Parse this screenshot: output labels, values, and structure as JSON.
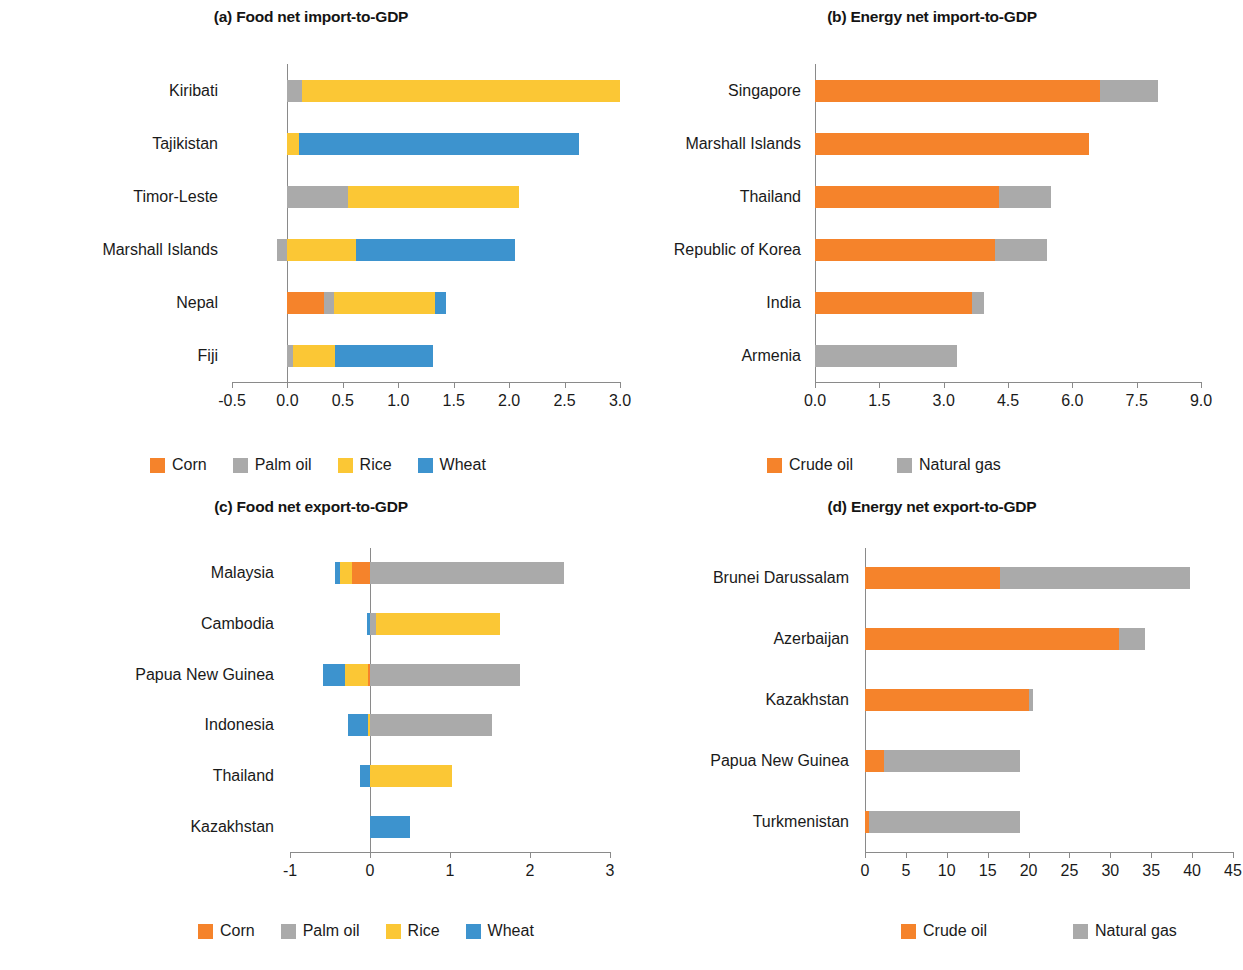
{
  "figure": {
    "width": 1243,
    "height": 970
  },
  "colors": {
    "corn": "#F5832B",
    "crude_oil": "#F5832B",
    "palm_oil": "#AAAAAA",
    "natural_gas": "#AAAAAA",
    "rice": "#FBC735",
    "wheat": "#3D93CE",
    "axis": "#8A8A8A",
    "text": "#1A1A1A"
  },
  "legends": {
    "food": [
      {
        "label": "Corn",
        "color_key": "corn",
        "icon": "legend-swatch-corn"
      },
      {
        "label": "Palm oil",
        "color_key": "palm_oil",
        "icon": "legend-swatch-palm-oil"
      },
      {
        "label": "Rice",
        "color_key": "rice",
        "icon": "legend-swatch-rice"
      },
      {
        "label": "Wheat",
        "color_key": "wheat",
        "icon": "legend-swatch-wheat"
      }
    ],
    "energy": [
      {
        "label": "Crude oil",
        "color_key": "crude_oil",
        "icon": "legend-swatch-crude-oil"
      },
      {
        "label": "Natural gas",
        "color_key": "natural_gas",
        "icon": "legend-swatch-natural-gas"
      }
    ]
  },
  "chart_data": [
    {
      "id": "panel-a",
      "type": "bar",
      "orientation": "horizontal",
      "stacked": true,
      "title": "(a) Food net import-to-GDP",
      "xlabel": "",
      "ylabel": "",
      "xlim": [
        -0.5,
        3.0
      ],
      "ticks": [
        -0.5,
        0.0,
        0.5,
        1.0,
        1.5,
        2.0,
        2.5,
        3.0
      ],
      "tick_labels": [
        "-0.5",
        "0.0",
        "0.5",
        "1.0",
        "1.5",
        "2.0",
        "2.5",
        "3.0"
      ],
      "grid": false,
      "legend": "food",
      "legend_position": "bottom",
      "categories": [
        "Kiribati",
        "Tajikistan",
        "Timor-Leste",
        "Marshall Islands",
        "Nepal",
        "Fiji"
      ],
      "series": [
        {
          "name": "Corn",
          "color_key": "corn",
          "values": [
            0.0,
            0.0,
            0.0,
            0.0,
            0.33,
            0.0
          ]
        },
        {
          "name": "Palm oil",
          "color_key": "palm_oil",
          "values": [
            0.13,
            0.0,
            0.55,
            -0.09,
            0.09,
            0.05
          ]
        },
        {
          "name": "Rice",
          "color_key": "rice",
          "values": [
            2.87,
            0.1,
            1.54,
            0.62,
            0.91,
            0.38
          ]
        },
        {
          "name": "Wheat",
          "color_key": "wheat",
          "values": [
            0.0,
            2.53,
            0.0,
            1.43,
            0.1,
            0.88
          ]
        }
      ],
      "totals": [
        3.0,
        2.63,
        2.09,
        2.05,
        1.43,
        1.31
      ]
    },
    {
      "id": "panel-b",
      "type": "bar",
      "orientation": "horizontal",
      "stacked": true,
      "title": "(b) Energy net import-to-GDP",
      "xlabel": "",
      "ylabel": "",
      "xlim": [
        0.0,
        9.0
      ],
      "ticks": [
        0.0,
        1.5,
        3.0,
        4.5,
        6.0,
        7.5,
        9.0
      ],
      "tick_labels": [
        "0.0",
        "1.5",
        "3.0",
        "4.5",
        "6.0",
        "7.5",
        "9.0"
      ],
      "grid": false,
      "legend": "energy",
      "legend_position": "bottom",
      "categories": [
        "Singapore",
        "Marshall Islands",
        "Thailand",
        "Republic of Korea",
        "India",
        "Armenia"
      ],
      "series": [
        {
          "name": "Crude oil",
          "color_key": "crude_oil",
          "values": [
            6.65,
            6.4,
            4.3,
            4.2,
            3.65,
            0.0
          ]
        },
        {
          "name": "Natural gas",
          "color_key": "natural_gas",
          "values": [
            1.35,
            0.0,
            1.2,
            1.2,
            0.3,
            3.3
          ]
        }
      ],
      "totals": [
        8.0,
        6.4,
        5.5,
        5.4,
        3.95,
        3.3
      ]
    },
    {
      "id": "panel-c",
      "type": "bar",
      "orientation": "horizontal",
      "stacked": true,
      "title": "(c) Food net export-to-GDP",
      "xlabel": "",
      "ylabel": "",
      "xlim": [
        -1.0,
        3.0
      ],
      "ticks": [
        -1,
        0,
        1,
        2,
        3
      ],
      "tick_labels": [
        "-1",
        "0",
        "1",
        "2",
        "3"
      ],
      "grid": false,
      "legend": "food",
      "legend_position": "bottom",
      "categories": [
        "Malaysia",
        "Cambodia",
        "Papua New Guinea",
        "Indonesia",
        "Thailand",
        "Kazakhstan"
      ],
      "series": [
        {
          "name": "Corn",
          "color_key": "corn",
          "values": [
            -0.22,
            0.0,
            -0.03,
            0.0,
            0.0,
            0.0
          ]
        },
        {
          "name": "Palm oil",
          "color_key": "palm_oil",
          "values": [
            2.43,
            0.08,
            1.87,
            1.53,
            0.0,
            0.0
          ]
        },
        {
          "name": "Rice",
          "color_key": "rice",
          "values": [
            -0.15,
            1.55,
            -0.28,
            -0.03,
            1.02,
            0.0
          ]
        },
        {
          "name": "Wheat",
          "color_key": "wheat",
          "values": [
            -0.07,
            -0.04,
            -0.28,
            -0.25,
            -0.13,
            0.5
          ]
        }
      ],
      "totals": [
        1.99,
        1.59,
        1.28,
        1.25,
        0.89,
        0.5
      ]
    },
    {
      "id": "panel-d",
      "type": "bar",
      "orientation": "horizontal",
      "stacked": true,
      "title": "(d) Energy net export-to-GDP",
      "xlabel": "",
      "ylabel": "",
      "xlim": [
        0,
        45
      ],
      "ticks": [
        0,
        5,
        10,
        15,
        20,
        25,
        30,
        35,
        40,
        45
      ],
      "tick_labels": [
        "0",
        "5",
        "10",
        "15",
        "20",
        "25",
        "30",
        "35",
        "40",
        "45"
      ],
      "grid": false,
      "legend": "energy",
      "legend_position": "bottom",
      "categories": [
        "Brunei Darussalam",
        "Azerbaijan",
        "Kazakhstan",
        "Papua New Guinea",
        "Turkmenistan"
      ],
      "series": [
        {
          "name": "Crude oil",
          "color_key": "crude_oil",
          "values": [
            16.5,
            31.0,
            20.0,
            2.3,
            0.5
          ]
        },
        {
          "name": "Natural gas",
          "color_key": "natural_gas",
          "values": [
            23.3,
            3.3,
            0.6,
            16.7,
            18.4
          ]
        }
      ],
      "totals": [
        39.8,
        34.3,
        20.6,
        19.0,
        18.9
      ]
    }
  ]
}
